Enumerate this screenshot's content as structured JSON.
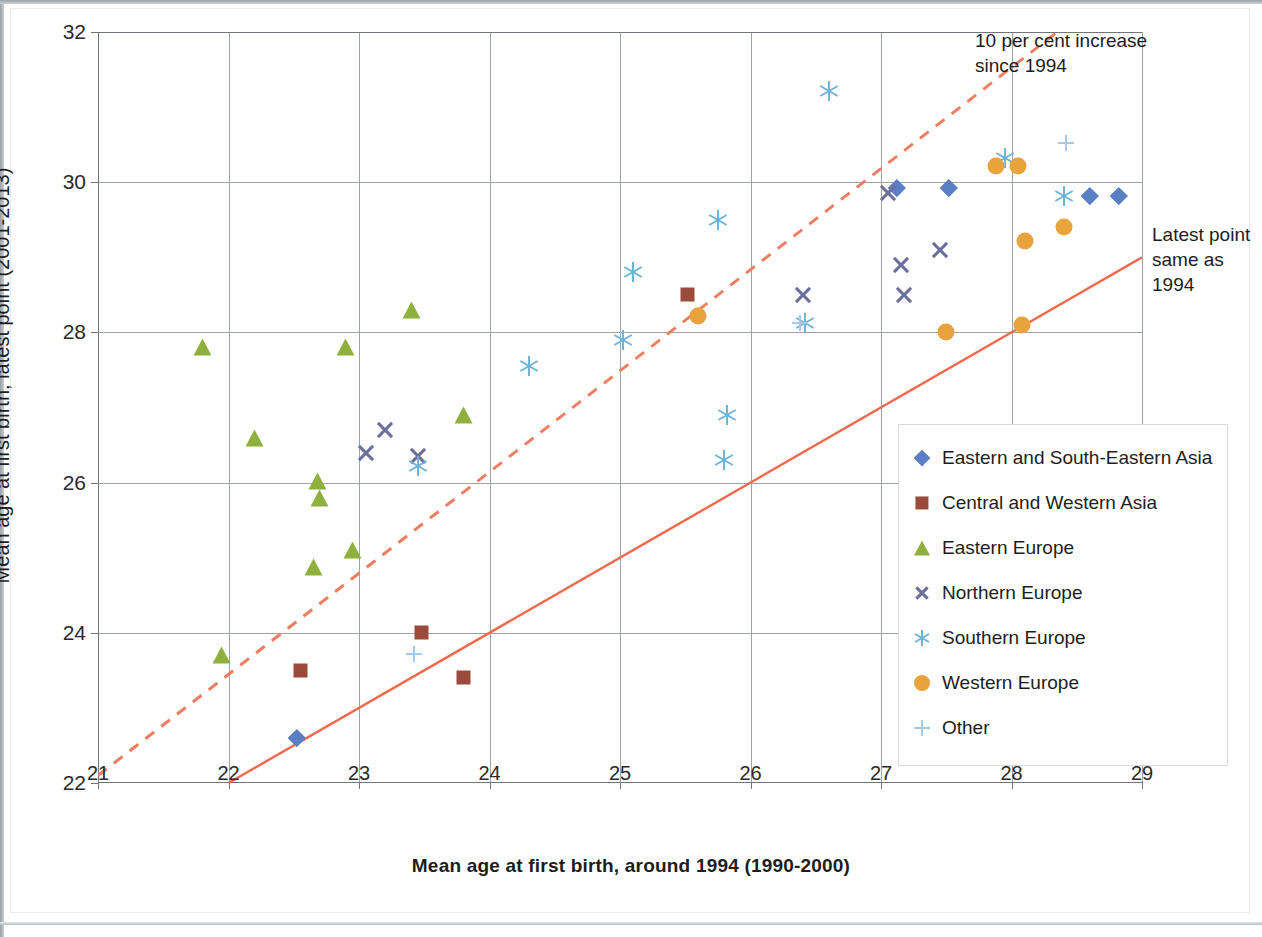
{
  "chart_data": {
    "type": "scatter",
    "title": "",
    "xlabel": "Mean age at first birth, around 1994 (1990-2000)",
    "ylabel": "Mean age at first birth, latest point (2001-2013)",
    "xlim": [
      21,
      29
    ],
    "ylim": [
      22,
      32
    ],
    "xticks": [
      "21",
      "22",
      "23",
      "24",
      "25",
      "26",
      "27",
      "28",
      "29"
    ],
    "yticks": [
      "22",
      "24",
      "26",
      "28",
      "30",
      "32"
    ],
    "grid": true,
    "legend_position": "right-inside",
    "annotations": [
      {
        "id": "dashed-line-note",
        "text": "10 per cent increase since 1994"
      },
      {
        "id": "solid-line-note",
        "text": "Latest point same as 1994"
      }
    ],
    "reference_lines": [
      {
        "name": "ten-per-cent-increase",
        "style": "dashed",
        "color": "#ef7d61",
        "from": [
          21,
          22.1
        ],
        "to": [
          28.35,
          32
        ]
      },
      {
        "name": "parity-line",
        "style": "solid",
        "color": "#ef6a4c",
        "from": [
          22,
          22
        ],
        "to": [
          29,
          29
        ]
      }
    ],
    "series": [
      {
        "name": "Eastern and South-Eastern Asia",
        "marker": "diamond",
        "color": "#5b7fc4",
        "points": [
          [
            22.52,
            22.6
          ],
          [
            27.12,
            29.92
          ],
          [
            27.52,
            29.92
          ],
          [
            28.6,
            29.82
          ],
          [
            28.82,
            29.82
          ]
        ]
      },
      {
        "name": "Central and Western Asia",
        "marker": "square",
        "color": "#9c4b3a",
        "points": [
          [
            22.55,
            23.5
          ],
          [
            23.48,
            24.0
          ],
          [
            23.8,
            23.4
          ],
          [
            25.52,
            28.5
          ]
        ]
      },
      {
        "name": "Eastern Europe",
        "marker": "triangle",
        "color": "#8db13c",
        "points": [
          [
            21.8,
            27.8
          ],
          [
            21.95,
            23.7
          ],
          [
            22.2,
            26.6
          ],
          [
            22.65,
            24.88
          ],
          [
            22.68,
            26.02
          ],
          [
            22.7,
            25.8
          ],
          [
            22.9,
            27.8
          ],
          [
            22.95,
            25.1
          ],
          [
            23.4,
            28.3
          ],
          [
            23.8,
            26.9
          ]
        ]
      },
      {
        "name": "Northern Europe",
        "marker": "x",
        "color": "#6b6f9e",
        "points": [
          [
            23.05,
            26.4
          ],
          [
            23.2,
            26.7
          ],
          [
            23.45,
            26.35
          ],
          [
            26.4,
            28.5
          ],
          [
            27.05,
            29.85
          ],
          [
            27.15,
            28.9
          ],
          [
            27.18,
            28.5
          ],
          [
            27.45,
            29.1
          ]
        ]
      },
      {
        "name": "Southern Europe",
        "marker": "asterisk",
        "color": "#6cb4d8",
        "points": [
          [
            23.45,
            26.22
          ],
          [
            24.3,
            27.55
          ],
          [
            25.02,
            27.9
          ],
          [
            25.1,
            28.8
          ],
          [
            25.75,
            29.5
          ],
          [
            25.8,
            26.3
          ],
          [
            25.82,
            26.9
          ],
          [
            26.42,
            28.12
          ],
          [
            26.6,
            31.22
          ],
          [
            27.95,
            30.32
          ],
          [
            28.4,
            29.82
          ]
        ]
      },
      {
        "name": "Western Europe",
        "marker": "circle",
        "color": "#e8a33d",
        "points": [
          [
            25.6,
            28.22
          ],
          [
            27.5,
            28.0
          ],
          [
            27.88,
            30.22
          ],
          [
            28.05,
            30.22
          ],
          [
            28.08,
            28.1
          ],
          [
            28.1,
            29.22
          ],
          [
            28.4,
            29.4
          ]
        ]
      },
      {
        "name": "Other",
        "marker": "plus",
        "color": "#a8c8e8",
        "points": [
          [
            23.42,
            23.72
          ],
          [
            26.38,
            28.12
          ],
          [
            28.42,
            30.52
          ]
        ]
      }
    ]
  },
  "legend": {
    "items": [
      {
        "label": "Eastern and South-Eastern Asia",
        "marker": "diamond",
        "color": "#5b7fc4"
      },
      {
        "label": "Central and Western Asia",
        "marker": "square",
        "color": "#9c4b3a"
      },
      {
        "label": "Eastern Europe",
        "marker": "triangle",
        "color": "#8db13c"
      },
      {
        "label": "Northern Europe",
        "marker": "x",
        "color": "#6b6f9e"
      },
      {
        "label": "Southern Europe",
        "marker": "asterisk",
        "color": "#6cb4d8"
      },
      {
        "label": "Western Europe",
        "marker": "circle",
        "color": "#e8a33d"
      },
      {
        "label": "Other",
        "marker": "plus",
        "color": "#a8c8e8"
      }
    ]
  },
  "annotations": {
    "dashed_note": "10 per cent increase since 1994",
    "solid_note": "Latest point same as 1994"
  }
}
